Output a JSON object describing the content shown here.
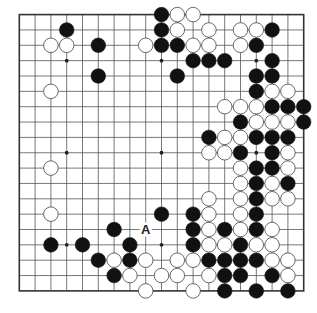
{
  "board": {
    "size": 19,
    "origin_x": 19.3,
    "origin_y": 14.6,
    "spacing_x": 15.8,
    "spacing_y": 15.35,
    "colors": {
      "black": "#111111",
      "white": "#ffffff",
      "line": "#555555",
      "background": "#ffffff"
    },
    "star_points": [
      [
        3,
        3
      ],
      [
        9,
        3
      ],
      [
        15,
        3
      ],
      [
        3,
        9
      ],
      [
        9,
        9
      ],
      [
        15,
        9
      ],
      [
        3,
        15
      ],
      [
        9,
        15
      ],
      [
        15,
        15
      ]
    ],
    "black_stones": [
      [
        9,
        0
      ],
      [
        3,
        1
      ],
      [
        9,
        1
      ],
      [
        16,
        1
      ],
      [
        5,
        2
      ],
      [
        9,
        2
      ],
      [
        10,
        2
      ],
      [
        15,
        2
      ],
      [
        11,
        3
      ],
      [
        12,
        3
      ],
      [
        13,
        3
      ],
      [
        16,
        3
      ],
      [
        5,
        4
      ],
      [
        10,
        4
      ],
      [
        15,
        4
      ],
      [
        16,
        4
      ],
      [
        15,
        5
      ],
      [
        16,
        6
      ],
      [
        17,
        6
      ],
      [
        18,
        6
      ],
      [
        14,
        7
      ],
      [
        18,
        7
      ],
      [
        12,
        8
      ],
      [
        15,
        8
      ],
      [
        16,
        8
      ],
      [
        17,
        8
      ],
      [
        14,
        9
      ],
      [
        16,
        9
      ],
      [
        15,
        10
      ],
      [
        16,
        10
      ],
      [
        15,
        11
      ],
      [
        17,
        11
      ],
      [
        15,
        12
      ],
      [
        9,
        13
      ],
      [
        11,
        13
      ],
      [
        15,
        13
      ],
      [
        6,
        14
      ],
      [
        11,
        14
      ],
      [
        13,
        14
      ],
      [
        15,
        14
      ],
      [
        2,
        15
      ],
      [
        4,
        15
      ],
      [
        7,
        15
      ],
      [
        11,
        15
      ],
      [
        14,
        15
      ],
      [
        5,
        16
      ],
      [
        7,
        16
      ],
      [
        12,
        16
      ],
      [
        13,
        16
      ],
      [
        14,
        16
      ],
      [
        15,
        16
      ],
      [
        6,
        17
      ],
      [
        13,
        17
      ],
      [
        14,
        17
      ],
      [
        16,
        17
      ],
      [
        13,
        18
      ],
      [
        15,
        18
      ],
      [
        17,
        18
      ]
    ],
    "white_stones": [
      [
        10,
        0
      ],
      [
        11,
        0
      ],
      [
        10,
        1
      ],
      [
        12,
        1
      ],
      [
        14,
        1
      ],
      [
        15,
        1
      ],
      [
        2,
        2
      ],
      [
        3,
        2
      ],
      [
        8,
        2
      ],
      [
        11,
        2
      ],
      [
        12,
        2
      ],
      [
        14,
        2
      ],
      [
        2,
        5
      ],
      [
        16,
        5
      ],
      [
        17,
        5
      ],
      [
        13,
        6
      ],
      [
        14,
        6
      ],
      [
        15,
        6
      ],
      [
        15,
        7
      ],
      [
        16,
        7
      ],
      [
        17,
        7
      ],
      [
        13,
        8
      ],
      [
        14,
        8
      ],
      [
        12,
        9
      ],
      [
        13,
        9
      ],
      [
        17,
        9
      ],
      [
        2,
        10
      ],
      [
        14,
        10
      ],
      [
        17,
        10
      ],
      [
        14,
        11
      ],
      [
        16,
        11
      ],
      [
        12,
        12
      ],
      [
        14,
        12
      ],
      [
        16,
        12
      ],
      [
        17,
        12
      ],
      [
        2,
        13
      ],
      [
        12,
        13
      ],
      [
        14,
        13
      ],
      [
        12,
        14
      ],
      [
        14,
        14
      ],
      [
        16,
        14
      ],
      [
        12,
        15
      ],
      [
        13,
        15
      ],
      [
        15,
        15
      ],
      [
        16,
        15
      ],
      [
        6,
        16
      ],
      [
        8,
        16
      ],
      [
        10,
        16
      ],
      [
        11,
        16
      ],
      [
        16,
        16
      ],
      [
        17,
        16
      ],
      [
        7,
        17
      ],
      [
        9,
        17
      ],
      [
        10,
        17
      ],
      [
        12,
        17
      ],
      [
        17,
        17
      ],
      [
        8,
        18
      ],
      [
        11,
        18
      ]
    ],
    "labels": [
      {
        "text": "A",
        "col": 8,
        "row": 14
      }
    ]
  }
}
